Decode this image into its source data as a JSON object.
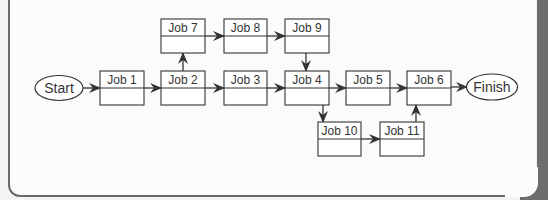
{
  "diagram": {
    "type": "activity-network",
    "start": {
      "label": "Start"
    },
    "finish": {
      "label": "Finish"
    },
    "jobs": [
      {
        "id": "job1",
        "label": "Job 1"
      },
      {
        "id": "job2",
        "label": "Job 2"
      },
      {
        "id": "job3",
        "label": "Job 3"
      },
      {
        "id": "job4",
        "label": "Job 4"
      },
      {
        "id": "job5",
        "label": "Job 5"
      },
      {
        "id": "job6",
        "label": "Job 6"
      },
      {
        "id": "job7",
        "label": "Job 7"
      },
      {
        "id": "job8",
        "label": "Job 8"
      },
      {
        "id": "job9",
        "label": "Job 9"
      },
      {
        "id": "job10",
        "label": "Job 10"
      },
      {
        "id": "job11",
        "label": "Job 11"
      }
    ],
    "edges": [
      [
        "start",
        "job1"
      ],
      [
        "job1",
        "job2"
      ],
      [
        "job2",
        "job3"
      ],
      [
        "job2",
        "job7"
      ],
      [
        "job7",
        "job8"
      ],
      [
        "job8",
        "job9"
      ],
      [
        "job9",
        "job4"
      ],
      [
        "job3",
        "job4"
      ],
      [
        "job4",
        "job5"
      ],
      [
        "job5",
        "job6"
      ],
      [
        "job4",
        "job10"
      ],
      [
        "job10",
        "job11"
      ],
      [
        "job11",
        "job6"
      ],
      [
        "job6",
        "finish"
      ]
    ],
    "colors": {
      "stroke": "#333333",
      "background": "#fbfbfb",
      "frame": "#6e6e6e"
    }
  }
}
